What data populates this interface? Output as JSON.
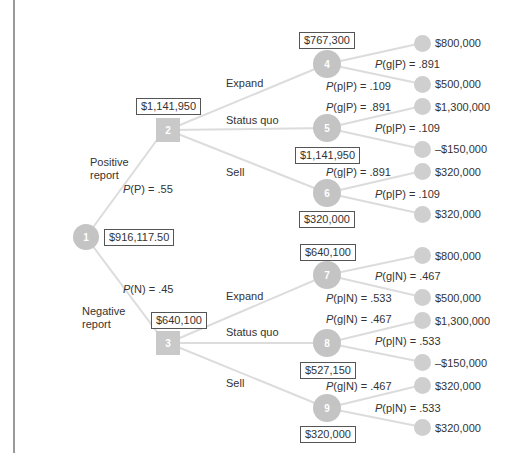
{
  "colors": {
    "edge": "#d9d9d9",
    "node_fill": "#c4c4c4",
    "text": "#333333",
    "box_border": "#555555"
  },
  "root": {
    "id": "1",
    "ev": "$916,117.50"
  },
  "branches": {
    "positive": {
      "label_line1": "Positive",
      "label_line2": "report",
      "prob": "P(P) = .55"
    },
    "negative": {
      "label_line1": "Negative",
      "label_line2": "report",
      "prob": "P(N) = .45"
    }
  },
  "decisions": [
    {
      "id": "2",
      "ev": "$1,141,950"
    },
    {
      "id": "3",
      "ev": "$640,100"
    }
  ],
  "actions": {
    "expand": "Expand",
    "status_quo": "Status quo",
    "sell": "Sell"
  },
  "chance_nodes": [
    {
      "id": "4",
      "ev": "$767,300",
      "p_good": "P(g|P) = .891",
      "p_poor": "P(p|P) = .109",
      "good_payoff": "$800,000",
      "poor_payoff": "$500,000"
    },
    {
      "id": "5",
      "ev": "$1,141,950",
      "p_good": "P(g|P) = .891",
      "p_poor": "P(p|P) = .109",
      "good_payoff": "$1,300,000",
      "poor_payoff": "–$150,000"
    },
    {
      "id": "6",
      "ev": "$320,000",
      "p_good": "P(g|P) = .891",
      "p_poor": "P(p|P) = .109",
      "good_payoff": "$320,000",
      "poor_payoff": "$320,000"
    },
    {
      "id": "7",
      "ev": "$640,100",
      "p_good": "P(g|N) = .467",
      "p_poor": "P(p|N) = .533",
      "good_payoff": "$800,000",
      "poor_payoff": "$500,000"
    },
    {
      "id": "8",
      "ev": "$527,150",
      "p_good": "P(g|N) = .467",
      "p_poor": "P(p|N) = .533",
      "good_payoff": "$1,300,000",
      "poor_payoff": "–$150,000"
    },
    {
      "id": "9",
      "ev": "$320,000",
      "p_good": "P(g|N) = .467",
      "p_poor": "P(p|N) = .533",
      "good_payoff": "$320,000",
      "poor_payoff": "$320,000"
    }
  ]
}
